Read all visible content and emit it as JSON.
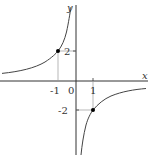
{
  "diagram": {
    "function": "y = -2/x",
    "axes": {
      "x_label": "x",
      "y_label": "y",
      "origin_label": "0"
    },
    "ticks": {
      "x": [
        {
          "value": -1,
          "label": "-1"
        },
        {
          "value": 1,
          "label": "1"
        }
      ],
      "y": [
        {
          "value": 2,
          "label": "2"
        },
        {
          "value": -2,
          "label": "-2"
        }
      ]
    },
    "points": [
      {
        "x": -1,
        "y": 2
      },
      {
        "x": 1,
        "y": -2
      }
    ],
    "colors": {
      "axis": "#333333",
      "curve": "#444444",
      "guide": "#999999",
      "point": "#000000"
    }
  }
}
